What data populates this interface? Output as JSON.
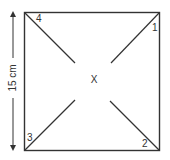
{
  "diagram": {
    "dimension_label": "15 cm",
    "center_label": "X",
    "corners": [
      {
        "label": "1",
        "position": "top-right"
      },
      {
        "label": "2",
        "position": "bottom-right"
      },
      {
        "label": "3",
        "position": "bottom-left"
      },
      {
        "label": "4",
        "position": "top-left"
      }
    ],
    "colors": {
      "line": "#333333",
      "background": "#ffffff"
    }
  }
}
